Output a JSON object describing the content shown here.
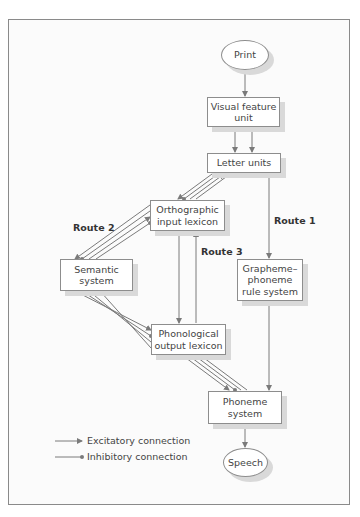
{
  "diagram": {
    "type": "flowchart",
    "nodes": {
      "print": "Print",
      "visual_feature": "Visual feature unit",
      "letter_units": "Letter units",
      "orthographic": "Orthographic input lexicon",
      "semantic": "Semantic system",
      "grapheme": "Grapheme–phoneme rule system",
      "phonological": "Phonological output lexicon",
      "phoneme": "Phoneme system",
      "speech": "Speech"
    },
    "routes": {
      "route1": "Route 1",
      "route2": "Route 2",
      "route3": "Route 3"
    },
    "edges": [
      {
        "from": "Print",
        "to": "Visual feature unit",
        "type": "excitatory"
      },
      {
        "from": "Visual feature unit",
        "to": "Letter units",
        "type": "excitatory",
        "count": 2
      },
      {
        "from": "Letter units",
        "to": "Orthographic input lexicon",
        "type": "bidirectional-mixed"
      },
      {
        "from": "Letter units",
        "to": "Grapheme–phoneme rule system",
        "type": "excitatory",
        "route": "Route 1"
      },
      {
        "from": "Orthographic input lexicon",
        "to": "Semantic system",
        "type": "bidirectional-mixed",
        "route": "Route 2"
      },
      {
        "from": "Orthographic input lexicon",
        "to": "Phonological output lexicon",
        "type": "bidirectional",
        "route": "Route 3"
      },
      {
        "from": "Semantic system",
        "to": "Phonological output lexicon",
        "type": "bidirectional-mixed",
        "route": "Route 2"
      },
      {
        "from": "Phonological output lexicon",
        "to": "Phoneme system",
        "type": "bidirectional-mixed"
      },
      {
        "from": "Grapheme–phoneme rule system",
        "to": "Phoneme system",
        "type": "excitatory",
        "route": "Route 1"
      },
      {
        "from": "Phoneme system",
        "to": "Speech",
        "type": "excitatory"
      }
    ],
    "legend": {
      "excitatory": "Excitatory connection",
      "inhibitory": "Inhibitory connection"
    },
    "colors": {
      "line": "#7a7a7a",
      "box_border": "#8d8d8d",
      "shadow": "#d9d9d9",
      "frame": "#8a8a8a"
    }
  }
}
